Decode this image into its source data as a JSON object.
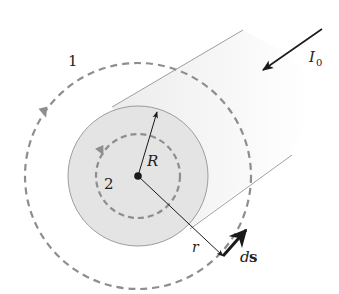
{
  "diagram": {
    "labels": {
      "loop_outer": "1",
      "loop_inner": "2",
      "radius_conductor": "R",
      "radius_loop": "r",
      "current": "I",
      "current_subscript": "0",
      "path_element_d": "d",
      "path_element_s": "s"
    },
    "colors": {
      "conductor_face": "#e4e4e4",
      "conductor_side": "#f3f3f3",
      "dashed_loop": "#8e8e8e",
      "outline": "#777777",
      "arrows": "#1a1a1a"
    }
  }
}
